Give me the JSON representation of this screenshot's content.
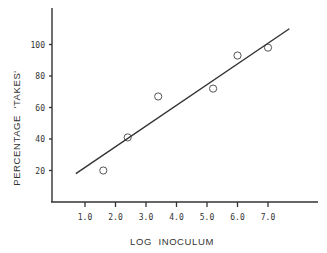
{
  "chart_data": {
    "type": "scatter",
    "title": "",
    "xlabel": "LOG  INOCULUM",
    "ylabel": "PERCENTAGE  'TAKES'",
    "xlim": [
      0,
      8.5
    ],
    "ylim": [
      0,
      120
    ],
    "grid": false,
    "legend": null,
    "x_ticks": [
      1.0,
      2.0,
      3.0,
      4.0,
      5.0,
      6.0,
      7.0
    ],
    "x_tick_labels": [
      "1.0",
      "2.0",
      "3.0",
      "4.0",
      "5.0",
      "6.0",
      "7.0"
    ],
    "y_ticks": [
      20,
      40,
      60,
      80,
      100
    ],
    "y_tick_labels": [
      "20",
      "40",
      "60",
      "80",
      "100"
    ],
    "series": [
      {
        "name": "observed",
        "marker": "open-circle",
        "points": [
          {
            "x": 1.6,
            "y": 20
          },
          {
            "x": 2.4,
            "y": 41
          },
          {
            "x": 3.4,
            "y": 67
          },
          {
            "x": 5.2,
            "y": 72
          },
          {
            "x": 6.0,
            "y": 93
          },
          {
            "x": 7.0,
            "y": 98
          }
        ]
      },
      {
        "name": "fitted line",
        "type": "line",
        "points": [
          {
            "x": 0.7,
            "y": 18
          },
          {
            "x": 7.7,
            "y": 110
          }
        ]
      }
    ],
    "colors": {
      "ink": "#333333",
      "background": "#ffffff"
    }
  }
}
